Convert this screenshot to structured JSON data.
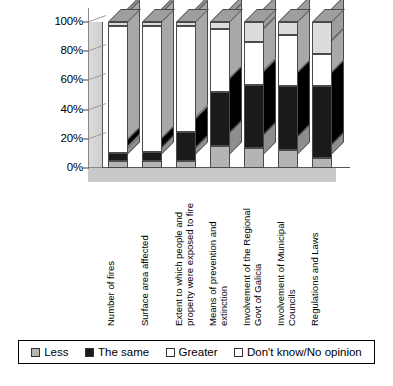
{
  "chart_data": {
    "type": "bar",
    "subtype": "stacked-percentage-3d",
    "title": "",
    "subtitle": "",
    "xlabel": "",
    "ylabel": "",
    "ylim": [
      0,
      100
    ],
    "yticks": [
      "0%",
      "20%",
      "40%",
      "60%",
      "80%",
      "100%"
    ],
    "ytick_values": [
      0,
      20,
      40,
      60,
      80,
      100
    ],
    "grid": true,
    "legend_position": "bottom",
    "categories": [
      "Number of fires",
      "Surface area affected",
      "Extent to which people and property were exposed to fire",
      "Means of prevention and extinction",
      "Involvement of the Regional Govt of Galicia",
      "Involvement of Municipal Councils",
      "Regulations and Laws"
    ],
    "series": [
      {
        "name": "Less",
        "color": "#b4b4b4",
        "values": [
          5,
          5,
          5,
          15,
          14,
          12,
          7
        ]
      },
      {
        "name": "The same",
        "color": "#1a1a1a",
        "values": [
          5,
          6,
          20,
          37,
          43,
          44,
          49
        ]
      },
      {
        "name": "Greater",
        "color": "#ffffff",
        "values": [
          87,
          86,
          72,
          43,
          29,
          35,
          22
        ]
      },
      {
        "name": "Don't know/No opinion",
        "color": "#dcdcdc",
        "values": [
          3,
          3,
          3,
          5,
          14,
          9,
          22
        ]
      }
    ]
  },
  "legend": {
    "items": [
      {
        "label": "Less",
        "swatch": "swatch-less"
      },
      {
        "label": "The same",
        "swatch": "swatch-the-same"
      },
      {
        "label": "Greater",
        "swatch": "swatch-greater"
      },
      {
        "label": "Don't know/No opinion",
        "swatch": "swatch-dont-know"
      }
    ]
  }
}
